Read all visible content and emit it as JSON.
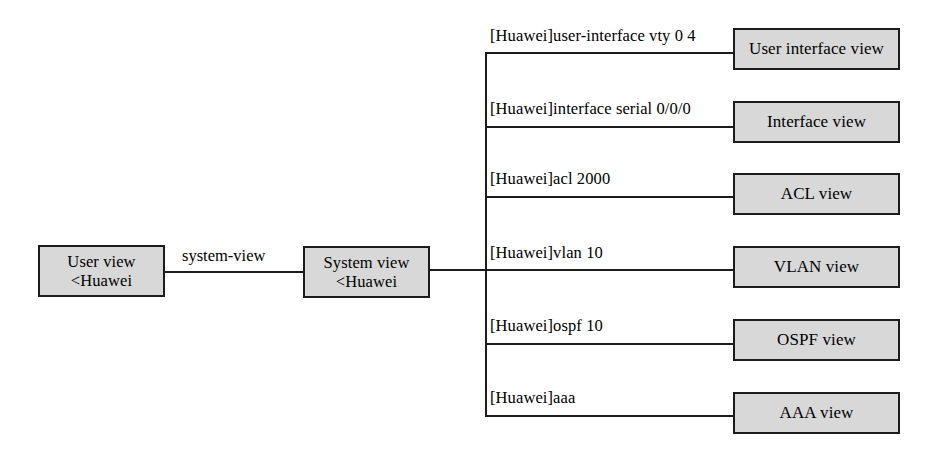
{
  "diagram": {
    "background_color": "#ffffff",
    "box_fill_color": "#d8d8d8",
    "box_border_color": "#1c1c1c",
    "line_color": "#1c1c1c"
  },
  "left_nodes": [
    {
      "id": "user-view",
      "label": "User view\n<Huawei"
    },
    {
      "id": "system-view",
      "label": "System view\n<Huawei"
    }
  ],
  "edge_labels": [
    {
      "id": "system-view-command",
      "label": "system-view"
    }
  ],
  "branches": [
    {
      "id": "user-interface",
      "command": "[Huawei]user-interface vty 0 4",
      "view": "User interface view"
    },
    {
      "id": "interface",
      "command": "[Huawei]interface serial 0/0/0",
      "view": "Interface view"
    },
    {
      "id": "acl",
      "command": "[Huawei]acl 2000",
      "view": "ACL view"
    },
    {
      "id": "vlan",
      "command": "[Huawei]vlan 10",
      "view": "VLAN view"
    },
    {
      "id": "ospf",
      "command": "[Huawei]ospf 10",
      "view": "OSPF view"
    },
    {
      "id": "aaa",
      "command": "[Huawei]aaa",
      "view": "AAA view"
    }
  ]
}
